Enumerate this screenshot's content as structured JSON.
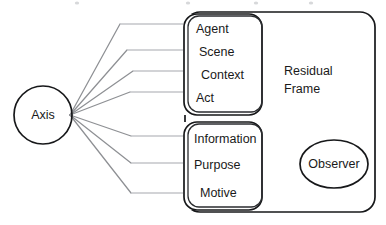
{
  "diagram": {
    "colors": {
      "shape_outline": "#17181a",
      "connector_diagonal": "#8e9094",
      "connector_horizontal": "#c3c5c8",
      "text": "#1a1a1a",
      "background": "#ffffff"
    },
    "source_node": {
      "label": "Axis",
      "shape": "circle",
      "cx": 43,
      "cy": 115,
      "r": 29
    },
    "outer_frame": {
      "label_line1": "Residual",
      "label_line2": "Frame",
      "shape": "rounded-rectangle",
      "x": 185,
      "y": 12,
      "width": 190,
      "height": 200
    },
    "group_top": {
      "name": "upper-category-box",
      "shape": "rounded-rectangle",
      "x": 188,
      "y": 14,
      "width": 74,
      "height": 101,
      "items": [
        {
          "label": "Agent",
          "x": 196,
          "y": 30
        },
        {
          "label": "Scene",
          "x": 199,
          "y": 53
        },
        {
          "label": "Context",
          "x": 201,
          "y": 76
        },
        {
          "label": "Act",
          "x": 196,
          "y": 99
        }
      ]
    },
    "group_bottom": {
      "name": "lower-category-box",
      "shape": "rounded-rectangle",
      "x": 188,
      "y": 122,
      "width": 74,
      "height": 88,
      "items": [
        {
          "label": "Information",
          "x": 194,
          "y": 140
        },
        {
          "label": "Purpose",
          "x": 194,
          "y": 166
        },
        {
          "label": "Motive",
          "x": 200,
          "y": 194
        }
      ]
    },
    "observer_node": {
      "label": "Observer",
      "shape": "ellipse",
      "cx": 334,
      "cy": 164,
      "rx": 34,
      "ry": 24
    },
    "connectors": [
      {
        "name": "axis-to-agent",
        "bend_x": 120,
        "target_y": 24,
        "end_x": 188
      },
      {
        "name": "axis-to-scene",
        "bend_x": 127,
        "target_y": 50,
        "end_x": 188
      },
      {
        "name": "axis-to-context",
        "bend_x": 133,
        "target_y": 71,
        "end_x": 188
      },
      {
        "name": "axis-to-act",
        "bend_x": 130,
        "target_y": 92,
        "end_x": 188
      },
      {
        "name": "axis-to-information",
        "bend_x": 131,
        "target_y": 136,
        "end_x": 188
      },
      {
        "name": "axis-to-purpose",
        "bend_x": 131,
        "target_y": 163,
        "end_x": 188
      },
      {
        "name": "axis-to-motive",
        "bend_x": 131,
        "target_y": 193,
        "end_x": 188
      }
    ],
    "fan_origin": {
      "x": 70,
      "y": 115
    }
  }
}
